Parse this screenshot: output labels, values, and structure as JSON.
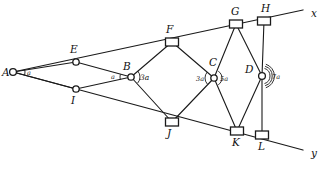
{
  "diagram": {
    "type": "geometric-construction",
    "canvas": {
      "width": 326,
      "height": 173
    },
    "background_color": "#ffffff",
    "stroke_color": "#1a1a1a",
    "rays": [
      {
        "id": "ray-x",
        "label": "x",
        "label_x": 311,
        "label_y": 17,
        "from": "A",
        "through": "E",
        "end_x": 303,
        "end_y": 10
      },
      {
        "id": "ray-y",
        "label": "y",
        "label_x": 311,
        "label_y": 157,
        "from": "A",
        "through": "I",
        "end_x": 303,
        "end_y": 150
      }
    ],
    "points": [
      {
        "id": "A",
        "label": "A",
        "x": 13,
        "y": 72,
        "marker": "circle",
        "r": 3.4,
        "label_x": 2,
        "label_y": 76
      },
      {
        "id": "E",
        "label": "E",
        "x": 76,
        "y": 62,
        "marker": "circle",
        "r": 3.2,
        "label_x": 70,
        "label_y": 53
      },
      {
        "id": "I",
        "label": "I",
        "x": 76,
        "y": 89,
        "marker": "circle",
        "r": 3.2,
        "label_x": 71,
        "label_y": 104
      },
      {
        "id": "B",
        "label": "B",
        "x": 131,
        "y": 77,
        "marker": "circle",
        "r": 3.2,
        "label_x": 123,
        "label_y": 70
      },
      {
        "id": "C",
        "label": "C",
        "x": 214,
        "y": 78,
        "marker": "circle",
        "r": 3.2,
        "label_x": 209,
        "label_y": 66
      },
      {
        "id": "D",
        "label": "D",
        "x": 262,
        "y": 76,
        "marker": "circle",
        "r": 3.4,
        "label_x": 245,
        "label_y": 73
      },
      {
        "id": "F",
        "label": "F",
        "x": 172,
        "y": 42,
        "marker": "square",
        "w": 13,
        "h": 8,
        "label_x": 166,
        "label_y": 33
      },
      {
        "id": "G",
        "label": "G",
        "x": 236,
        "y": 24,
        "marker": "square",
        "w": 13,
        "h": 8,
        "label_x": 231,
        "label_y": 15
      },
      {
        "id": "H",
        "label": "H",
        "x": 264,
        "y": 21,
        "marker": "square",
        "w": 13,
        "h": 8,
        "label_x": 261,
        "label_y": 12
      },
      {
        "id": "J",
        "label": "J",
        "x": 172,
        "y": 122,
        "marker": "square",
        "w": 13,
        "h": 8,
        "label_x": 167,
        "label_y": 137
      },
      {
        "id": "K",
        "label": "K",
        "x": 237,
        "y": 131,
        "marker": "square",
        "w": 13,
        "h": 8,
        "label_x": 232,
        "label_y": 146
      },
      {
        "id": "L",
        "label": "L",
        "x": 262,
        "y": 135,
        "marker": "square",
        "w": 13,
        "h": 8,
        "label_x": 258,
        "label_y": 150
      }
    ],
    "segments": [
      {
        "from": "A",
        "to": "E"
      },
      {
        "from": "A",
        "to": "I"
      },
      {
        "from": "E",
        "to": "B"
      },
      {
        "from": "I",
        "to": "B"
      },
      {
        "from": "B",
        "to": "F"
      },
      {
        "from": "B",
        "to": "J"
      },
      {
        "from": "F",
        "to": "C"
      },
      {
        "from": "J",
        "to": "C"
      },
      {
        "from": "C",
        "to": "G"
      },
      {
        "from": "C",
        "to": "K"
      },
      {
        "from": "G",
        "to": "D"
      },
      {
        "from": "K",
        "to": "D"
      },
      {
        "from": "D",
        "to": "H"
      },
      {
        "from": "D",
        "to": "L"
      }
    ],
    "angle_marks": [
      {
        "id": "angle-A",
        "label": "a",
        "vertex": "A",
        "label_x": 27,
        "label_y": 75,
        "arcs": 1,
        "arc_r": 12,
        "start_deg": -14,
        "end_deg": 14,
        "size": "small"
      },
      {
        "id": "angle-B-left",
        "label": "a",
        "vertex": "B",
        "label_x": 111,
        "label_y": 79,
        "arcs": 1,
        "arc_r": 11,
        "start_deg": 166,
        "end_deg": 194,
        "size": "small"
      },
      {
        "id": "angle-B-right",
        "label": "3a",
        "vertex": "B",
        "label_x": 140,
        "label_y": 80,
        "arcs": 1,
        "arc_r": 9,
        "start_deg": -42,
        "end_deg": 42,
        "size": "normal"
      },
      {
        "id": "angle-C-left",
        "label": "3a",
        "vertex": "C",
        "label_x": 196,
        "label_y": 81,
        "arcs": 1,
        "arc_r": 9,
        "start_deg": 138,
        "end_deg": 222,
        "size": "small"
      },
      {
        "id": "angle-C-right",
        "label": "5a",
        "vertex": "C",
        "label_x": 220,
        "label_y": 81,
        "arcs": 1,
        "arc_r": 8,
        "start_deg": -58,
        "end_deg": 58,
        "size": "small"
      },
      {
        "id": "angle-D-right",
        "label": "7a",
        "vertex": "D",
        "label_x": 272,
        "label_y": 79,
        "arcs": 3,
        "arc_r": 8,
        "start_deg": -72,
        "end_deg": 72,
        "size": "small"
      }
    ]
  }
}
